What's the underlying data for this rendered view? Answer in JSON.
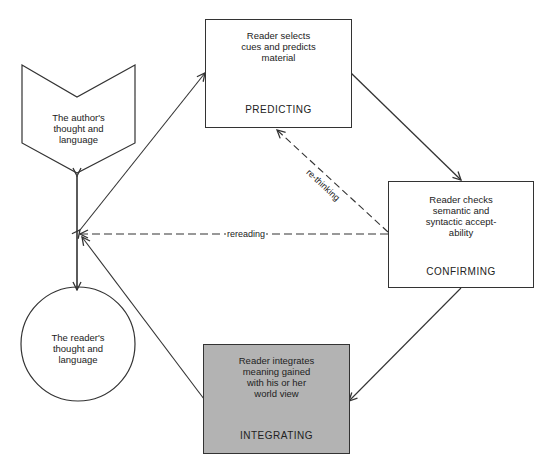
{
  "diagram": {
    "nodes": {
      "author": {
        "text_lines": [
          "The author's",
          "thought and",
          "language"
        ],
        "shape": "chevron-pentagon"
      },
      "reader": {
        "text_lines": [
          "The reader's",
          "thought and",
          "language"
        ],
        "shape": "circle"
      },
      "predicting": {
        "desc_lines": [
          "Reader selects",
          "cues and predicts",
          "material"
        ],
        "stage": "PREDICTING",
        "fill": "#ffffff"
      },
      "confirming": {
        "desc_lines": [
          "Reader checks",
          "semantic and",
          "syntactic accept-",
          "ability"
        ],
        "stage": "CONFIRMING",
        "fill": "#ffffff"
      },
      "integrating": {
        "desc_lines": [
          "Reader integrates",
          "meaning gained",
          "with his or her",
          "world view"
        ],
        "stage": "INTEGRATING",
        "fill": "#b3b3b3"
      }
    },
    "edges": [
      {
        "from": "author",
        "to": "reader",
        "style": "solid",
        "bidirectional": true
      },
      {
        "from": "hub",
        "to": "predicting",
        "style": "solid",
        "bidirectional": true
      },
      {
        "from": "predicting",
        "to": "confirming",
        "style": "solid"
      },
      {
        "from": "confirming",
        "to": "integrating",
        "style": "solid"
      },
      {
        "from": "integrating",
        "to": "hub",
        "style": "solid"
      },
      {
        "from": "confirming",
        "to": "predicting",
        "style": "dashed",
        "label": "re-thinking"
      },
      {
        "from": "confirming",
        "to": "hub",
        "style": "dashed",
        "label": "rereading"
      }
    ],
    "colors": {
      "line": "#333333",
      "integrating_fill": "#b3b3b3"
    }
  }
}
